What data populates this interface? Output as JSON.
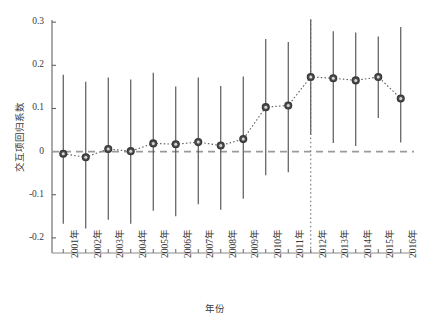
{
  "figure": {
    "faint_header_text": "　　　　　　　　　　　　　　　　　　　　　　　　　",
    "faint_footer_text": "　　　　　　　　",
    "background_color": "#ffffff",
    "marker_color": "#3a3a3a",
    "errorbar_color": "#4a4a4a",
    "zeroline_color": "#9a9a9a",
    "refline_color": "#6a6a6a",
    "series_line_color": "#5a5a5a"
  },
  "chart_data": {
    "type": "line",
    "title": "",
    "subtitle": "",
    "xlabel": "年份",
    "ylabel": "交互项回归系数",
    "grid": false,
    "legend": null,
    "xlim": [
      0.5,
      16.5
    ],
    "ylim": [
      -0.235,
      0.305
    ],
    "ytick_values": [
      0.3,
      0.2,
      0.1,
      0,
      -0.1,
      -0.2
    ],
    "ytick_labels": [
      "0.3",
      "0.2",
      "0.1",
      "0",
      "-0.1",
      "-0.2"
    ],
    "categories": [
      "2001年",
      "2002年",
      "2003年",
      "2004年",
      "2005年",
      "2006年",
      "2007年",
      "2008年",
      "2009年",
      "2010年",
      "2011年",
      "2012年",
      "2013年",
      "2014年",
      "2015年",
      "2016年"
    ],
    "values": [
      -0.005,
      -0.013,
      0.006,
      0.001,
      0.019,
      0.017,
      0.022,
      0.014,
      0.029,
      0.103,
      0.107,
      0.173,
      0.17,
      0.165,
      0.173,
      0.123
    ],
    "error_upper": [
      0.178,
      0.162,
      0.172,
      0.167,
      0.183,
      0.151,
      0.172,
      0.152,
      0.174,
      0.261,
      0.254,
      0.307,
      0.279,
      0.276,
      0.267,
      0.289
    ],
    "error_lower": [
      -0.167,
      -0.178,
      -0.158,
      -0.167,
      -0.137,
      -0.15,
      -0.122,
      -0.135,
      -0.109,
      -0.055,
      -0.048,
      0.039,
      0.02,
      0.013,
      0.078,
      0.021
    ],
    "annotations": [
      {
        "kind": "hline",
        "y": 0,
        "style": "dashed",
        "label": "零参考线"
      },
      {
        "kind": "vline",
        "x": "2012年",
        "style": "dotted",
        "label": "政策实施年"
      }
    ]
  }
}
